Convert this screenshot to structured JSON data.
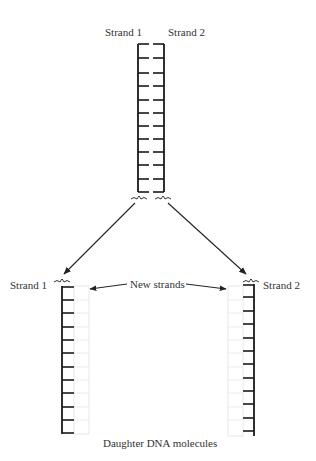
{
  "diagram": {
    "parent": {
      "strand1_label": "Strand 1",
      "strand2_label": "Strand 2",
      "rung_count": 11
    },
    "daughters": {
      "left_label": "Strand 1",
      "right_label": "Strand 2",
      "new_strands_label": "New strands",
      "caption": "Daughter DNA molecules",
      "rung_count": 10
    },
    "colors": {
      "backbone": "#1a1a1a",
      "new_strand": "#d8d8d8",
      "text": "#333333"
    }
  }
}
